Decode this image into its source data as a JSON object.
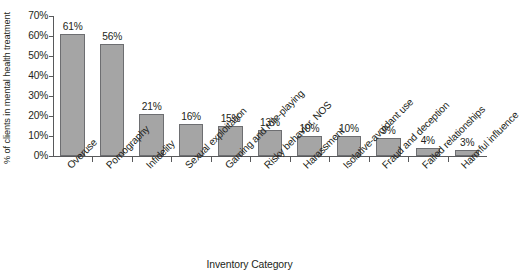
{
  "chart_data": {
    "type": "bar",
    "title": "",
    "xlabel": "Inventory Category",
    "ylabel": "% of clients in mental health treatment",
    "ylim": [
      0,
      70
    ],
    "ytick_labels": [
      "70%",
      "60%",
      "50%",
      "40%",
      "30%",
      "20%",
      "10%",
      "0%"
    ],
    "ytick_values": [
      70,
      60,
      50,
      40,
      30,
      20,
      10,
      0
    ],
    "grid": false,
    "legend": false,
    "bar_color": "#a5a5a5",
    "bar_edge_color": "#6d6e71",
    "axis_color": "#58595b",
    "categories": [
      "Overuse",
      "Pornography",
      "Infidelity",
      "Sexual exploitation",
      "Gaming and role-playing",
      "Risky behavior, NOS",
      "Harassment",
      "Isolative-avoidant use",
      "Fraud and deception",
      "Failed relationships",
      "Harmful influence"
    ],
    "values": [
      61,
      56,
      21,
      16,
      15,
      13,
      10,
      10,
      9,
      4,
      3
    ],
    "data_labels": [
      "61%",
      "56%",
      "21%",
      "16%",
      "15%",
      "13%",
      "10%",
      "10%",
      "9%",
      "4%",
      "3%"
    ]
  }
}
